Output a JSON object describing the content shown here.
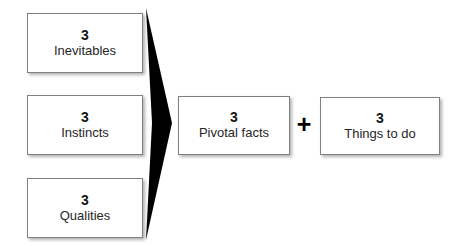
{
  "diagram": {
    "type": "convergence-flow",
    "background_color": "#ffffff",
    "inputs": [
      {
        "count": "3",
        "label": "Inevitables"
      },
      {
        "count": "3",
        "label": "Instincts"
      },
      {
        "count": "3",
        "label": "Qualities"
      }
    ],
    "result": {
      "count": "3",
      "label": "Pivotal facts"
    },
    "operator": {
      "symbol": "+",
      "name": "plus-sign"
    },
    "addend": {
      "count": "3",
      "label": "Things to do"
    },
    "arrow": {
      "name": "merge-arrow",
      "color": "#000000",
      "direction": "left-to-right"
    },
    "colors": {
      "box_border": "#808080",
      "box_fill": "#ffffff",
      "count_text": "#141414",
      "label_text": "#262626",
      "arrow": "#000000"
    }
  }
}
